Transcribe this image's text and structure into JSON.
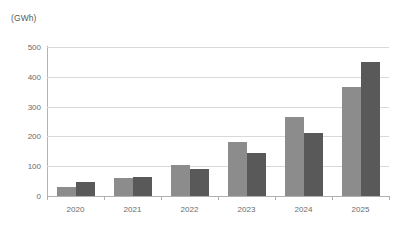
{
  "chart_data": {
    "type": "bar",
    "title": "",
    "unit_label": "(GWh)",
    "xlabel": "",
    "ylabel": "(GWh)",
    "categories": [
      "2020",
      "2021",
      "2022",
      "2023",
      "2024",
      "2025"
    ],
    "series": [
      {
        "name": "Series 1",
        "color": "#8c8c8c",
        "values": [
          30,
          60,
          104,
          181,
          265,
          365
        ]
      },
      {
        "name": "Series 2",
        "color": "#595959",
        "values": [
          47,
          65,
          90,
          144,
          211,
          450
        ]
      }
    ],
    "ylim": [
      0,
      500
    ],
    "y_ticks": [
      0,
      100,
      200,
      300,
      400,
      500
    ],
    "y_tick_labels": [
      "0",
      "100",
      "200",
      "300",
      "400",
      "500"
    ],
    "grid": true,
    "legend": "none",
    "gridline_color": "#d9d9d9",
    "axis_color": "#b0b0b0",
    "background": "#ffffff"
  }
}
